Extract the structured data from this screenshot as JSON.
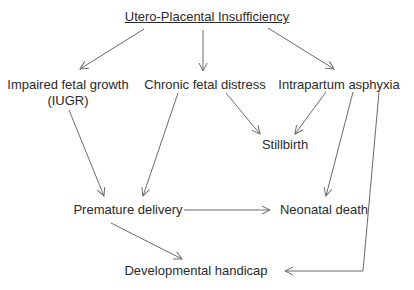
{
  "diagram": {
    "title": "Utero-Placental Insufficiency",
    "nodes": {
      "iugr_line1": "Impaired fetal growth",
      "iugr_line2": "(IUGR)",
      "chronic": "Chronic fetal distress",
      "asphyxia": "Intrapartum asphyxia",
      "stillbirth": "Stillbirth",
      "premature": "Premature delivery",
      "neonatal": "Neonatal death",
      "handicap": "Developmental handicap"
    },
    "edges": [
      {
        "from": "Utero-Placental Insufficiency",
        "to": "Impaired fetal growth (IUGR)"
      },
      {
        "from": "Utero-Placental Insufficiency",
        "to": "Chronic fetal distress"
      },
      {
        "from": "Utero-Placental Insufficiency",
        "to": "Intrapartum asphyxia"
      },
      {
        "from": "Chronic fetal distress",
        "to": "Stillbirth"
      },
      {
        "from": "Intrapartum asphyxia",
        "to": "Stillbirth"
      },
      {
        "from": "Impaired fetal growth (IUGR)",
        "to": "Premature delivery"
      },
      {
        "from": "Chronic fetal distress",
        "to": "Premature delivery"
      },
      {
        "from": "Intrapartum asphyxia",
        "to": "Neonatal death"
      },
      {
        "from": "Premature delivery",
        "to": "Neonatal death"
      },
      {
        "from": "Premature delivery",
        "to": "Developmental handicap"
      },
      {
        "from": "Intrapartum asphyxia",
        "to": "Developmental handicap"
      }
    ],
    "colors": {
      "text": "#2a2a2a",
      "edge": "#6a6a6a",
      "background": "#ffffff"
    }
  }
}
